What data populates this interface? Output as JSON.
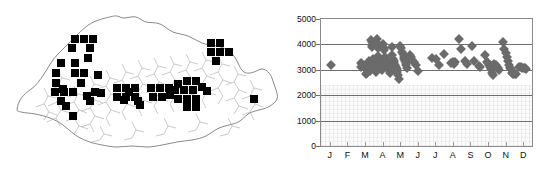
{
  "figure": {
    "panels": [
      "distribution-map",
      "elevation-scatter"
    ]
  },
  "map": {
    "region_name": "Bhutan",
    "marker_symbol": "filled-square",
    "marker_color": "#000000",
    "outline_color": "#6b6b6b",
    "marker_count": 61,
    "markers": [
      {
        "x": 75,
        "y": 39
      },
      {
        "x": 84,
        "y": 39
      },
      {
        "x": 93,
        "y": 39
      },
      {
        "x": 72,
        "y": 48
      },
      {
        "x": 90,
        "y": 48
      },
      {
        "x": 61,
        "y": 63
      },
      {
        "x": 75,
        "y": 63
      },
      {
        "x": 56,
        "y": 73
      },
      {
        "x": 75,
        "y": 73
      },
      {
        "x": 84,
        "y": 73
      },
      {
        "x": 56,
        "y": 83
      },
      {
        "x": 81,
        "y": 83
      },
      {
        "x": 55,
        "y": 92
      },
      {
        "x": 64,
        "y": 92
      },
      {
        "x": 73,
        "y": 92
      },
      {
        "x": 95,
        "y": 92
      },
      {
        "x": 61,
        "y": 101
      },
      {
        "x": 90,
        "y": 101
      },
      {
        "x": 63,
        "y": 89
      },
      {
        "x": 87,
        "y": 96
      },
      {
        "x": 73,
        "y": 116
      },
      {
        "x": 117,
        "y": 88
      },
      {
        "x": 126,
        "y": 88
      },
      {
        "x": 135,
        "y": 88
      },
      {
        "x": 117,
        "y": 97
      },
      {
        "x": 126,
        "y": 97
      },
      {
        "x": 135,
        "y": 97
      },
      {
        "x": 124,
        "y": 100
      },
      {
        "x": 138,
        "y": 101
      },
      {
        "x": 151,
        "y": 88
      },
      {
        "x": 160,
        "y": 88
      },
      {
        "x": 169,
        "y": 88
      },
      {
        "x": 153,
        "y": 97
      },
      {
        "x": 162,
        "y": 97
      },
      {
        "x": 140,
        "y": 105
      },
      {
        "x": 178,
        "y": 84
      },
      {
        "x": 187,
        "y": 81
      },
      {
        "x": 196,
        "y": 81
      },
      {
        "x": 175,
        "y": 90
      },
      {
        "x": 184,
        "y": 90
      },
      {
        "x": 193,
        "y": 90
      },
      {
        "x": 202,
        "y": 87
      },
      {
        "x": 178,
        "y": 99
      },
      {
        "x": 187,
        "y": 99
      },
      {
        "x": 196,
        "y": 99
      },
      {
        "x": 187,
        "y": 107
      },
      {
        "x": 196,
        "y": 107
      },
      {
        "x": 207,
        "y": 91
      },
      {
        "x": 211,
        "y": 43
      },
      {
        "x": 220,
        "y": 43
      },
      {
        "x": 211,
        "y": 52
      },
      {
        "x": 220,
        "y": 52
      },
      {
        "x": 229,
        "y": 52
      },
      {
        "x": 216,
        "y": 61
      },
      {
        "x": 254,
        "y": 99
      },
      {
        "x": 98,
        "y": 75
      },
      {
        "x": 101,
        "y": 93
      },
      {
        "x": 88,
        "y": 58
      },
      {
        "x": 66,
        "y": 106
      },
      {
        "x": 129,
        "y": 92
      },
      {
        "x": 170,
        "y": 95
      }
    ]
  },
  "chart_data": {
    "type": "scatter",
    "title": "",
    "xlabel": "",
    "ylabel": "",
    "marker": "diamond",
    "marker_color": "#6b6b6b",
    "grid": "horizontal",
    "legend": "none",
    "ylim": [
      0,
      5000
    ],
    "ytick_labels": [
      "5000",
      "4000",
      "3000",
      "2000",
      "1000",
      "0"
    ],
    "ytick_values": [
      5000,
      4000,
      3000,
      2000,
      1000,
      0
    ],
    "xlim": [
      0.5,
      12.5
    ],
    "categories": [
      "J",
      "F",
      "M",
      "A",
      "M",
      "J",
      "J",
      "A",
      "S",
      "O",
      "N",
      "D"
    ],
    "xtick_labels": [
      "J",
      "F",
      "M",
      "A",
      "M",
      "J",
      "J",
      "A",
      "S",
      "O",
      "N",
      "D"
    ],
    "points": [
      [
        1.05,
        3180
      ],
      [
        2.78,
        3270
      ],
      [
        2.86,
        3230
      ],
      [
        2.95,
        3150
      ],
      [
        2.8,
        3100
      ],
      [
        3.02,
        3060
      ],
      [
        3.05,
        2830
      ],
      [
        3.12,
        2880
      ],
      [
        3.18,
        3200
      ],
      [
        3.22,
        3330
      ],
      [
        3.25,
        3290
      ],
      [
        3.28,
        3050
      ],
      [
        3.3,
        2960
      ],
      [
        3.36,
        4160
      ],
      [
        3.38,
        4080
      ],
      [
        3.4,
        3960
      ],
      [
        3.42,
        3880
      ],
      [
        3.45,
        3430
      ],
      [
        3.48,
        3340
      ],
      [
        3.5,
        3250
      ],
      [
        3.52,
        3160
      ],
      [
        3.55,
        3080
      ],
      [
        3.58,
        2980
      ],
      [
        3.6,
        2900
      ],
      [
        3.66,
        4220
      ],
      [
        3.7,
        4050
      ],
      [
        3.74,
        3860
      ],
      [
        3.76,
        3560
      ],
      [
        3.8,
        3400
      ],
      [
        3.82,
        3330
      ],
      [
        3.85,
        3270
      ],
      [
        3.88,
        3210
      ],
      [
        3.9,
        3140
      ],
      [
        3.92,
        3060
      ],
      [
        3.95,
        2990
      ],
      [
        4.02,
        4000
      ],
      [
        4.06,
        3840
      ],
      [
        4.1,
        3760
      ],
      [
        4.14,
        3520
      ],
      [
        4.18,
        3380
      ],
      [
        4.2,
        3310
      ],
      [
        4.24,
        3250
      ],
      [
        4.28,
        3180
      ],
      [
        4.32,
        3100
      ],
      [
        4.36,
        3020
      ],
      [
        4.4,
        2950
      ],
      [
        4.44,
        2870
      ],
      [
        4.52,
        3880
      ],
      [
        4.56,
        3600
      ],
      [
        4.6,
        3440
      ],
      [
        4.64,
        3330
      ],
      [
        4.68,
        3260
      ],
      [
        4.72,
        3190
      ],
      [
        4.76,
        3110
      ],
      [
        4.8,
        3030
      ],
      [
        4.84,
        2930
      ],
      [
        4.88,
        2800
      ],
      [
        4.92,
        2640
      ],
      [
        5.02,
        3940
      ],
      [
        5.06,
        3840
      ],
      [
        5.1,
        3700
      ],
      [
        5.16,
        3620
      ],
      [
        5.2,
        3520
      ],
      [
        5.24,
        3430
      ],
      [
        5.28,
        3340
      ],
      [
        5.32,
        3260
      ],
      [
        5.36,
        3180
      ],
      [
        5.4,
        3090
      ],
      [
        5.56,
        3600
      ],
      [
        5.62,
        3500
      ],
      [
        5.7,
        3380
      ],
      [
        5.78,
        3300
      ],
      [
        5.9,
        3180
      ],
      [
        6.0,
        2960
      ],
      [
        6.82,
        3470
      ],
      [
        7.04,
        3420
      ],
      [
        7.2,
        3180
      ],
      [
        7.48,
        3620
      ],
      [
        7.9,
        3260
      ],
      [
        8.02,
        3320
      ],
      [
        8.06,
        3230
      ],
      [
        8.12,
        3290
      ],
      [
        8.36,
        4220
      ],
      [
        8.44,
        3830
      ],
      [
        8.7,
        3350
      ],
      [
        8.8,
        3210
      ],
      [
        9.06,
        3940
      ],
      [
        9.22,
        3360
      ],
      [
        9.5,
        3160
      ],
      [
        9.56,
        3100
      ],
      [
        9.8,
        3600
      ],
      [
        9.92,
        3320
      ],
      [
        10.0,
        3260
      ],
      [
        10.04,
        3180
      ],
      [
        10.1,
        3100
      ],
      [
        10.16,
        3040
      ],
      [
        10.2,
        2980
      ],
      [
        10.24,
        2880
      ],
      [
        10.28,
        2800
      ],
      [
        10.36,
        3240
      ],
      [
        10.44,
        3180
      ],
      [
        10.5,
        3120
      ],
      [
        10.56,
        3060
      ],
      [
        10.62,
        3000
      ],
      [
        10.86,
        4100
      ],
      [
        10.92,
        3820
      ],
      [
        11.0,
        3660
      ],
      [
        11.06,
        3510
      ],
      [
        11.12,
        3350
      ],
      [
        11.18,
        3180
      ],
      [
        11.24,
        3090
      ],
      [
        11.3,
        3030
      ],
      [
        11.36,
        2860
      ],
      [
        11.44,
        2850
      ],
      [
        11.52,
        2850
      ],
      [
        11.6,
        2850
      ],
      [
        11.78,
        3120
      ],
      [
        11.86,
        3100
      ],
      [
        11.94,
        3080
      ],
      [
        12.02,
        3060
      ],
      [
        12.1,
        3060
      ],
      [
        12.18,
        3050
      ]
    ]
  }
}
